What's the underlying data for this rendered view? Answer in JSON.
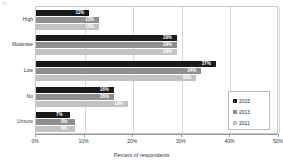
{
  "chart_data": {
    "type": "bar",
    "orientation": "horizontal",
    "title": "",
    "xlabel": "Percent of respondents",
    "ylabel": "",
    "xlim": [
      0,
      50
    ],
    "xticks": [
      "0%",
      "10%",
      "20%",
      "30%",
      "40%",
      "50%"
    ],
    "xtick_values": [
      0,
      10,
      20,
      30,
      40,
      50
    ],
    "grid": true,
    "grid_axis": "x",
    "legend_position": "right",
    "categories": [
      "High",
      "Moderate",
      "Low",
      "No",
      "Unsure"
    ],
    "series": [
      {
        "name": "2015",
        "color": "#1a1a1a",
        "values": [
          11,
          29,
          37,
          16,
          7
        ],
        "labels": [
          "11%",
          "29%",
          "37%",
          "16%",
          "7%"
        ]
      },
      {
        "name": "2013",
        "color": "#8f8f8f",
        "values": [
          13,
          29,
          34,
          16,
          8
        ],
        "labels": [
          "13%",
          "29%",
          "34%",
          "16%",
          "8%"
        ]
      },
      {
        "name": "2011",
        "color": "#c2c2c2",
        "values": [
          13,
          29,
          33,
          19,
          8
        ],
        "labels": [
          "13%",
          "29%",
          "33%",
          "19%",
          "8%"
        ]
      }
    ]
  },
  "legend": {
    "items": [
      {
        "label": "2015"
      },
      {
        "label": "2013"
      },
      {
        "label": "2011"
      }
    ]
  },
  "axis": {
    "x_title": "Percent of respondents",
    "ticks": [
      {
        "label": "0%"
      },
      {
        "label": "10%"
      },
      {
        "label": "20%"
      },
      {
        "label": "30%"
      },
      {
        "label": "40%"
      },
      {
        "label": "50%"
      }
    ]
  },
  "categories": [
    {
      "label": "High"
    },
    {
      "label": "Moderate"
    },
    {
      "label": "Low"
    },
    {
      "label": "No"
    },
    {
      "label": "Unsure"
    }
  ]
}
